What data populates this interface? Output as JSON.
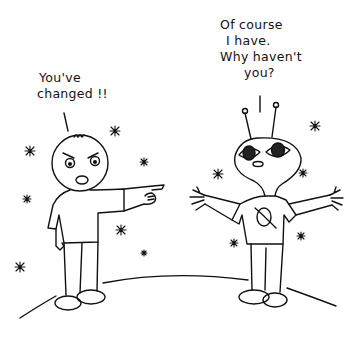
{
  "comic": {
    "left_speech": {
      "lines": [
        "You've",
        "changed !!"
      ]
    },
    "right_speech": {
      "lines": [
        "Of course",
        "I have.",
        "Why haven't",
        "you?"
      ]
    },
    "characters": [
      {
        "name": "angry-human",
        "description": "Angry boy pointing"
      },
      {
        "name": "alien",
        "description": "Alien with antennae and planet t-shirt, arms outstretched"
      }
    ],
    "colors": {
      "ink": "#111111",
      "background": "#ffffff"
    }
  }
}
